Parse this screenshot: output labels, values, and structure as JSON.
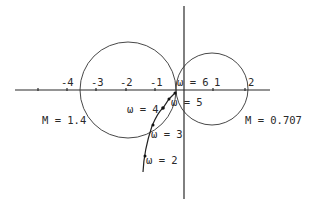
{
  "diagram": {
    "type": "Nyquist plot with constant-M circles",
    "axes": {
      "real_tick_labels": [
        "-4",
        "-3",
        "-2",
        "-1",
        "1",
        "2"
      ]
    },
    "m_circles": [
      {
        "label": "M = 1.4",
        "center_real": -1.9,
        "radius": 1.65
      },
      {
        "label": "M = 0.707",
        "center_real": 1.0,
        "radius": 1.2
      }
    ],
    "frequency_points": [
      {
        "label": "ω = 2"
      },
      {
        "label": "ω = 3"
      },
      {
        "label": "ω = 4"
      },
      {
        "label": "ω = 5"
      },
      {
        "label": "ω = 6"
      }
    ]
  }
}
